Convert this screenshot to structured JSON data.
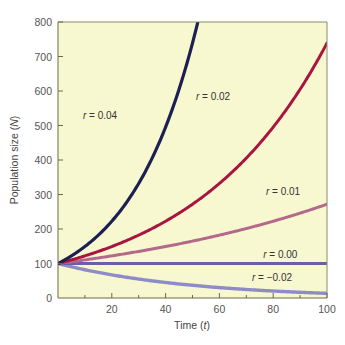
{
  "chart_data": {
    "type": "line",
    "title": "",
    "xlabel": "Time (t)",
    "xlabel_main": "Time (",
    "xlabel_var": "t",
    "xlabel_end": ")",
    "ylabel": "Population size (N)",
    "ylabel_main": "Population size (",
    "ylabel_var": "N",
    "ylabel_end": ")",
    "xlim": [
      0,
      100
    ],
    "ylim": [
      0,
      800
    ],
    "x_ticks": [
      20,
      40,
      60,
      80,
      100
    ],
    "x_minor_ticks": [
      10,
      30,
      50,
      70,
      90
    ],
    "y_ticks": [
      0,
      100,
      200,
      300,
      400,
      500,
      600,
      700,
      800
    ],
    "grid": false,
    "background": "#f8f8d0",
    "model": "N(t) = 100 * exp(r * t)",
    "N0": 100,
    "series": [
      {
        "name": "r = 0.04",
        "r": 0.04,
        "color": "#1c1f52",
        "x": [
          0,
          10,
          20,
          30,
          40,
          50,
          52
        ],
        "values": [
          100,
          149,
          223,
          332,
          495,
          739,
          800
        ]
      },
      {
        "name": "r = 0.02",
        "r": 0.02,
        "color": "#a8163f",
        "x": [
          0,
          10,
          20,
          30,
          40,
          50,
          60,
          70,
          80,
          90,
          100
        ],
        "values": [
          100,
          122,
          149,
          182,
          223,
          272,
          332,
          406,
          495,
          605,
          739
        ]
      },
      {
        "name": "r = 0.01",
        "r": 0.01,
        "color": "#b5698a",
        "x": [
          0,
          10,
          20,
          30,
          40,
          50,
          60,
          70,
          80,
          90,
          100
        ],
        "values": [
          100,
          111,
          122,
          135,
          149,
          165,
          182,
          201,
          223,
          246,
          272
        ]
      },
      {
        "name": "r = 0.00",
        "r": 0.0,
        "color": "#6b5fa6",
        "x": [
          0,
          100
        ],
        "values": [
          100,
          100
        ]
      },
      {
        "name": "r = −0.02",
        "r": -0.02,
        "color": "#8d8cc8",
        "x": [
          0,
          10,
          20,
          30,
          40,
          50,
          60,
          70,
          80,
          90,
          100
        ],
        "values": [
          100,
          82,
          67,
          55,
          45,
          37,
          30,
          25,
          20,
          17,
          14
        ]
      }
    ],
    "annotations": [
      {
        "series": 0,
        "r_sym": "r",
        "text": " = 0.04",
        "at": [
          22,
          520
        ]
      },
      {
        "series": 1,
        "r_sym": "r",
        "text": " = 0.02",
        "at": [
          64,
          575
        ]
      },
      {
        "series": 2,
        "r_sym": "r",
        "text": " = 0.01",
        "at": [
          90,
          298
        ]
      },
      {
        "series": 3,
        "r_sym": "r",
        "text": " = 0.00",
        "at": [
          89,
          115
        ]
      },
      {
        "series": 4,
        "r_sym": "r",
        "text": " = −0.02",
        "at": [
          87,
          48
        ]
      }
    ]
  }
}
